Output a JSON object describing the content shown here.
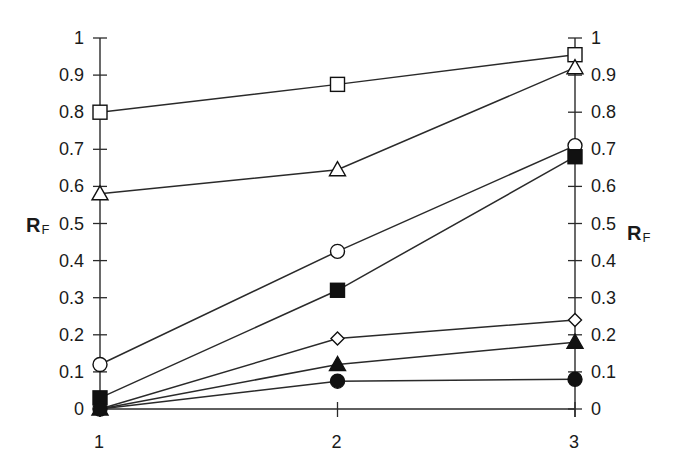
{
  "chart_data": {
    "type": "line",
    "title": "",
    "xlabel": "",
    "ylabel": "R_F",
    "ylabel_left": "R_F",
    "ylabel_right": "R_F",
    "x": [
      1,
      2,
      3
    ],
    "x_tick_labels": [
      "1",
      "2",
      "3"
    ],
    "ylim": [
      0,
      1
    ],
    "y_tick_labels": [
      "0",
      "0.1",
      "0.2",
      "0.3",
      "0.4",
      "0.5",
      "0.6",
      "0.7",
      "0.8",
      "0.9",
      "1"
    ],
    "grid": false,
    "legend": null,
    "dual_y_axis": true,
    "series": [
      {
        "name": "open-square",
        "marker": "square",
        "filled": false,
        "values": [
          0.8,
          0.875,
          0.955
        ]
      },
      {
        "name": "open-triangle",
        "marker": "triangle",
        "filled": false,
        "values": [
          0.58,
          0.645,
          0.92
        ]
      },
      {
        "name": "open-circle",
        "marker": "circle",
        "filled": false,
        "values": [
          0.12,
          0.425,
          0.71
        ]
      },
      {
        "name": "filled-square",
        "marker": "square",
        "filled": true,
        "values": [
          0.03,
          0.32,
          0.68
        ]
      },
      {
        "name": "open-diamond",
        "marker": "diamond",
        "filled": false,
        "values": [
          0.0,
          0.19,
          0.24
        ]
      },
      {
        "name": "filled-triangle",
        "marker": "triangle",
        "filled": true,
        "values": [
          0.0,
          0.12,
          0.18
        ]
      },
      {
        "name": "filled-circle",
        "marker": "circle",
        "filled": true,
        "values": [
          0.0,
          0.075,
          0.08
        ]
      }
    ]
  },
  "axes": {
    "left_title": "R",
    "left_title_sub": "F",
    "right_title": "R",
    "right_title_sub": "F"
  },
  "colors": {
    "line": "#2a2a2a",
    "marker": "#111111",
    "background": "#ffffff"
  }
}
